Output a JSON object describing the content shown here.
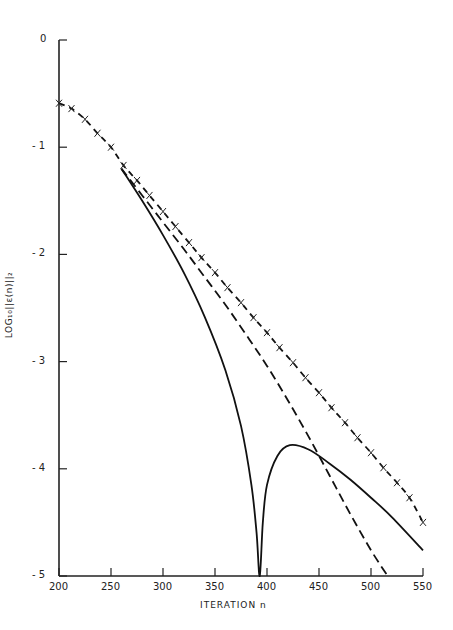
{
  "chart_data": {
    "type": "line",
    "title": "",
    "xlabel": "ITERATION n",
    "ylabel": "LOG10||e(n)||2",
    "xlim": [
      200,
      550
    ],
    "ylim": [
      -5,
      0
    ],
    "xticks": [
      200,
      250,
      300,
      350,
      400,
      450,
      500,
      550
    ],
    "yticks": [
      0,
      -1,
      -2,
      -3,
      -4,
      -5
    ],
    "grid": false,
    "legend": "none",
    "series": [
      {
        "name": "x-marked dashed",
        "style": "dashed-with-x-markers",
        "x": [
          200,
          212,
          225,
          237,
          250,
          262,
          275,
          287,
          300,
          312,
          325,
          337,
          350,
          362,
          375,
          387,
          400,
          412,
          425,
          437,
          450,
          462,
          475,
          487,
          500,
          512,
          525,
          537,
          550
        ],
        "y": [
          -0.59,
          -0.64,
          -0.74,
          -0.87,
          -1.0,
          -1.17,
          -1.31,
          -1.45,
          -1.6,
          -1.74,
          -1.89,
          -2.03,
          -2.17,
          -2.31,
          -2.45,
          -2.59,
          -2.73,
          -2.87,
          -3.01,
          -3.15,
          -3.29,
          -3.43,
          -3.57,
          -3.71,
          -3.85,
          -3.99,
          -4.13,
          -4.27,
          -4.5
        ]
      },
      {
        "name": "dashed",
        "style": "dashed",
        "x": [
          260,
          280,
          300,
          320,
          340,
          360,
          380,
          400,
          420,
          440,
          460,
          480,
          500,
          516
        ],
        "y": [
          -1.2,
          -1.45,
          -1.7,
          -1.95,
          -2.21,
          -2.47,
          -2.75,
          -3.04,
          -3.36,
          -3.7,
          -4.06,
          -4.42,
          -4.76,
          -5.0
        ]
      },
      {
        "name": "solid",
        "style": "solid",
        "x": [
          260,
          280,
          300,
          320,
          340,
          360,
          375,
          385,
          390,
          393,
          396,
          400,
          410,
          422,
          440,
          460,
          480,
          500,
          520,
          550
        ],
        "y": [
          -1.2,
          -1.5,
          -1.82,
          -2.17,
          -2.58,
          -3.08,
          -3.6,
          -4.15,
          -4.6,
          -5.0,
          -4.5,
          -4.15,
          -3.88,
          -3.78,
          -3.82,
          -3.95,
          -4.1,
          -4.27,
          -4.45,
          -4.76
        ]
      }
    ]
  },
  "labels": {
    "xlabel": "ITERATION  n",
    "ylabel": "LOG₁₀||ε(n)||₂"
  }
}
